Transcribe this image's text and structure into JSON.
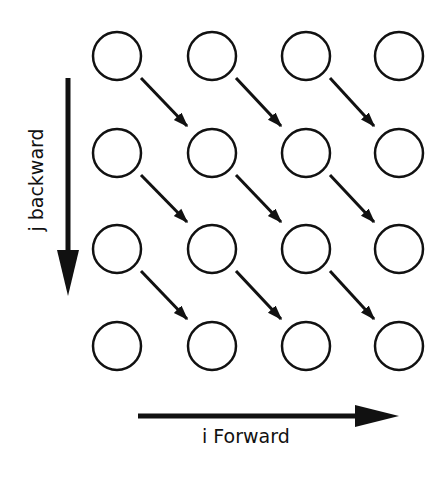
{
  "diagram": {
    "type": "loop-dependence-grid",
    "labels": {
      "i_axis": "i Forward",
      "j_axis": "j backward"
    },
    "grid": {
      "rows": 4,
      "cols": 4,
      "col_centers": [
        117,
        212,
        306,
        399
      ],
      "row_centers": [
        56,
        153,
        249,
        346
      ],
      "radius": 24
    },
    "dependency_arrows": "diagonal from (row r, col c) to (row r+1, col c+1) for r in 0..2, c in 0..2",
    "colors": {
      "stroke": "#111111",
      "background": "#ffffff"
    }
  }
}
